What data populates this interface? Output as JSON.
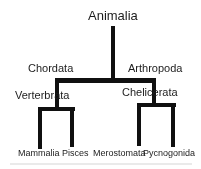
{
  "figure": {
    "type": "cladogram",
    "background_color": "#ffffff",
    "line_color": "#101010",
    "text_color": "#1c1c1c"
  },
  "tree": {
    "label": "Animalia",
    "children": [
      {
        "label": "Chordata",
        "children": [
          {
            "label": "Verterbrata",
            "children": [
              {
                "label": "Mammalia",
                "children": []
              },
              {
                "label": "Pisces",
                "children": []
              }
            ]
          }
        ]
      },
      {
        "label": "Arthropoda",
        "children": [
          {
            "label": "Chelicerata",
            "children": [
              {
                "label": "Merostomata",
                "children": []
              },
              {
                "label": "Pycnogonida",
                "children": []
              }
            ]
          }
        ]
      }
    ]
  }
}
